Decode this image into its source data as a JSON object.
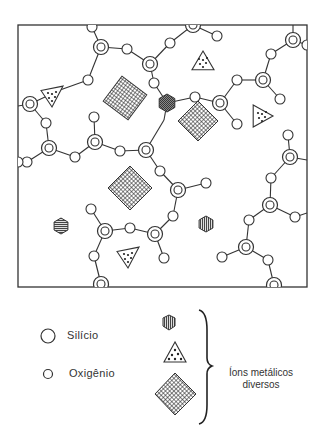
{
  "colors": {
    "ink": "#222222",
    "background": "#ffffff"
  },
  "legend": {
    "silicon_label": "Silício",
    "oxygen_label": "Oxigênio",
    "ions_caption_line1": "Íons metálicos",
    "ions_caption_line2": "diversos"
  },
  "frame": {
    "x": 18,
    "y": 25,
    "width": 289,
    "height": 262
  },
  "silicon_atoms": [
    [
      101,
      47
    ],
    [
      193,
      25
    ],
    [
      30,
      104
    ],
    [
      49,
      148
    ],
    [
      95,
      142
    ],
    [
      146,
      150
    ],
    [
      150,
      64
    ],
    [
      220,
      103
    ],
    [
      263,
      80
    ],
    [
      293,
      40
    ],
    [
      290,
      157
    ],
    [
      270,
      205
    ],
    [
      246,
      247
    ],
    [
      274,
      285
    ],
    [
      178,
      190
    ],
    [
      155,
      234
    ],
    [
      105,
      231
    ],
    [
      101,
      284
    ]
  ],
  "oxygen_atoms": [
    [
      92,
      27
    ],
    [
      127,
      49
    ],
    [
      170,
      43
    ],
    [
      217,
      36
    ],
    [
      88,
      80
    ],
    [
      46,
      123
    ],
    [
      27,
      162
    ],
    [
      75,
      157
    ],
    [
      94,
      117
    ],
    [
      120,
      151
    ],
    [
      154,
      83
    ],
    [
      195,
      97
    ],
    [
      237,
      80
    ],
    [
      237,
      124
    ],
    [
      271,
      54
    ],
    [
      280,
      99
    ],
    [
      288,
      135
    ],
    [
      271,
      178
    ],
    [
      295,
      217
    ],
    [
      249,
      220
    ],
    [
      222,
      257
    ],
    [
      268,
      260
    ],
    [
      160,
      171
    ],
    [
      206,
      183
    ],
    [
      173,
      216
    ],
    [
      130,
      228
    ],
    [
      91,
      209
    ],
    [
      94,
      256
    ],
    [
      164,
      258
    ],
    [
      18,
      162
    ],
    [
      307,
      45
    ]
  ],
  "bonds": [
    [
      92,
      27,
      101,
      47
    ],
    [
      101,
      47,
      127,
      49
    ],
    [
      101,
      47,
      88,
      80
    ],
    [
      127,
      49,
      150,
      64
    ],
    [
      150,
      64,
      170,
      43
    ],
    [
      170,
      43,
      193,
      25
    ],
    [
      193,
      25,
      217,
      36
    ],
    [
      88,
      80,
      60,
      90
    ],
    [
      60,
      90,
      30,
      104
    ],
    [
      30,
      104,
      46,
      123
    ],
    [
      30,
      104,
      18,
      106
    ],
    [
      46,
      123,
      49,
      148
    ],
    [
      49,
      148,
      27,
      162
    ],
    [
      27,
      162,
      18,
      164
    ],
    [
      49,
      148,
      75,
      157
    ],
    [
      75,
      157,
      95,
      142
    ],
    [
      95,
      142,
      94,
      117
    ],
    [
      95,
      142,
      120,
      151
    ],
    [
      120,
      151,
      146,
      150
    ],
    [
      146,
      150,
      160,
      171
    ],
    [
      146,
      150,
      164,
      120
    ],
    [
      164,
      120,
      167,
      103
    ],
    [
      150,
      64,
      154,
      83
    ],
    [
      154,
      83,
      167,
      103
    ],
    [
      167,
      103,
      195,
      97
    ],
    [
      195,
      97,
      220,
      103
    ],
    [
      220,
      103,
      237,
      124
    ],
    [
      220,
      103,
      237,
      80
    ],
    [
      237,
      80,
      263,
      80
    ],
    [
      263,
      80,
      271,
      54
    ],
    [
      271,
      54,
      293,
      40
    ],
    [
      293,
      40,
      293,
      25
    ],
    [
      293,
      40,
      307,
      45
    ],
    [
      263,
      80,
      280,
      99
    ],
    [
      288,
      135,
      290,
      157
    ],
    [
      290,
      157,
      271,
      178
    ],
    [
      290,
      157,
      307,
      160
    ],
    [
      271,
      178,
      270,
      205
    ],
    [
      270,
      205,
      295,
      217
    ],
    [
      295,
      217,
      307,
      213
    ],
    [
      270,
      205,
      249,
      220
    ],
    [
      249,
      220,
      246,
      247
    ],
    [
      246,
      247,
      222,
      257
    ],
    [
      246,
      247,
      268,
      260
    ],
    [
      268,
      260,
      274,
      285
    ],
    [
      160,
      171,
      178,
      190
    ],
    [
      178,
      190,
      206,
      183
    ],
    [
      178,
      190,
      173,
      216
    ],
    [
      173,
      216,
      155,
      234
    ],
    [
      155,
      234,
      130,
      228
    ],
    [
      130,
      228,
      105,
      231
    ],
    [
      105,
      231,
      91,
      209
    ],
    [
      105,
      231,
      94,
      256
    ],
    [
      94,
      256,
      101,
      284
    ],
    [
      155,
      234,
      164,
      258
    ]
  ],
  "ions": {
    "diamonds": [
      [
        125,
        98,
        22
      ],
      [
        198,
        121,
        20
      ],
      [
        130,
        188,
        22
      ]
    ],
    "triangles": [
      [
        52,
        96,
        "left"
      ],
      [
        203,
        62,
        "up"
      ],
      [
        262,
        116,
        "right"
      ],
      [
        128,
        257,
        "left"
      ]
    ],
    "hex_horizontal": [
      [
        61,
        226
      ]
    ],
    "hex_vertical": [
      [
        206,
        224
      ]
    ],
    "hex_dark": [
      [
        167,
        103
      ]
    ]
  }
}
